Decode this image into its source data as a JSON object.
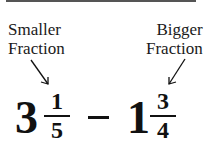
{
  "labels": {
    "left": {
      "line1": "Smaller",
      "line2": "Fraction"
    },
    "right": {
      "line1": "Bigger",
      "line2": "Fraction"
    }
  },
  "expression": {
    "first": {
      "whole": "3",
      "numerator": "1",
      "denominator": "5"
    },
    "operator": "−",
    "second": {
      "whole": "1",
      "numerator": "3",
      "denominator": "4"
    }
  },
  "colors": {
    "text": "#111111",
    "background": "#ffffff",
    "topbar": "#555555"
  }
}
